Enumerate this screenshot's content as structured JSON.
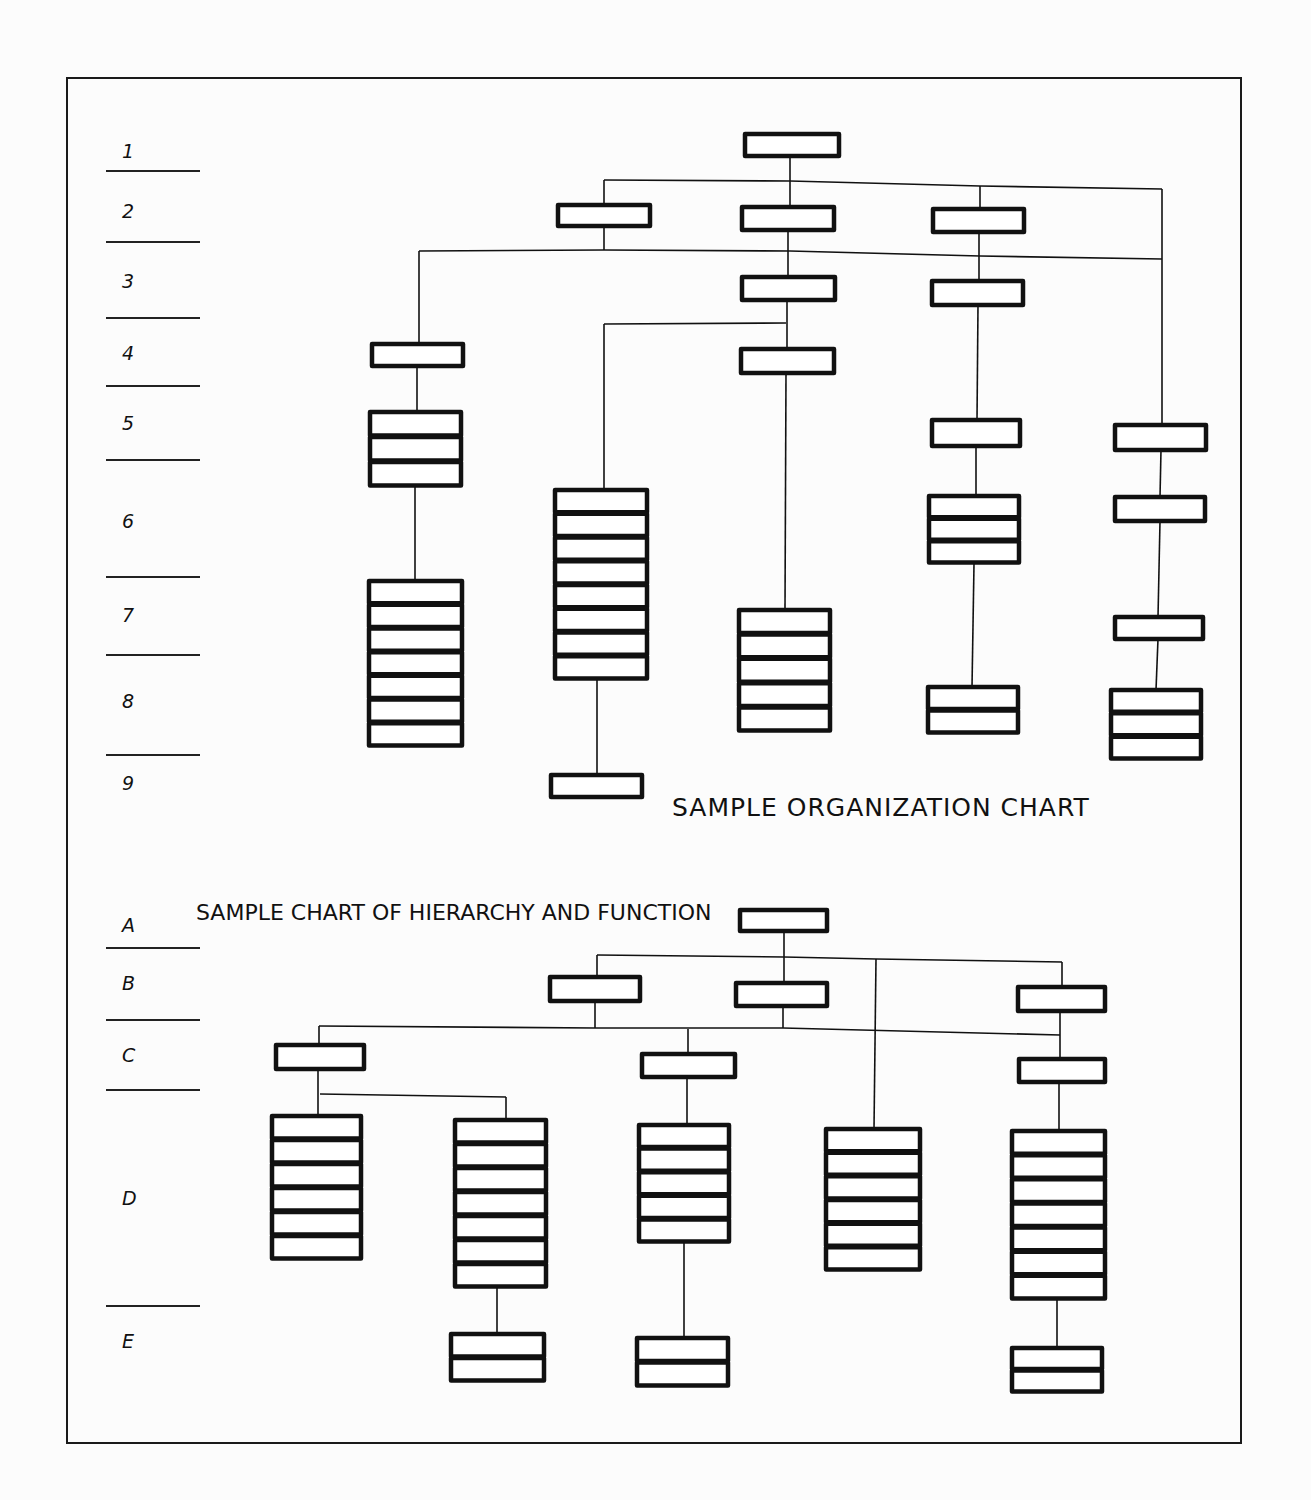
{
  "colors": {
    "ink": "#111111",
    "paper": "#fcfcfc"
  },
  "frame": {
    "x": 67,
    "y": 78,
    "w": 1174,
    "h": 1365
  },
  "top_chart": {
    "title": "SAMPLE ORGANIZATION CHART",
    "title_pos": {
      "x": 672,
      "y": 816
    },
    "levels": [
      {
        "label": "1",
        "ty": 158,
        "ry": 171
      },
      {
        "label": "2",
        "ty": 218,
        "ry": 242
      },
      {
        "label": "3",
        "ty": 288,
        "ry": 318
      },
      {
        "label": "4",
        "ty": 360,
        "ry": 386
      },
      {
        "label": "5",
        "ty": 430,
        "ry": 460
      },
      {
        "label": "6",
        "ty": 528,
        "ry": 577
      },
      {
        "label": "7",
        "ty": 622,
        "ry": 655
      },
      {
        "label": "8",
        "ty": 708,
        "ry": 755
      },
      {
        "label": "9",
        "ty": 790,
        "ry": null
      }
    ],
    "boxes": [
      {
        "x": 745,
        "y": 134,
        "w": 94,
        "h": 22,
        "n": 1
      },
      {
        "x": 558,
        "y": 205,
        "w": 92,
        "h": 21,
        "n": 1
      },
      {
        "x": 742,
        "y": 207,
        "w": 92,
        "h": 23,
        "n": 1
      },
      {
        "x": 933,
        "y": 209,
        "w": 91,
        "h": 23,
        "n": 1
      },
      {
        "x": 742,
        "y": 277,
        "w": 93,
        "h": 23,
        "n": 1
      },
      {
        "x": 932,
        "y": 281,
        "w": 91,
        "h": 24,
        "n": 1
      },
      {
        "x": 372,
        "y": 344,
        "w": 91,
        "h": 22,
        "n": 1
      },
      {
        "x": 741,
        "y": 349,
        "w": 93,
        "h": 24,
        "n": 1
      },
      {
        "x": 370,
        "y": 412,
        "w": 91,
        "h": 75,
        "n": 3
      },
      {
        "x": 932,
        "y": 420,
        "w": 88,
        "h": 26,
        "n": 1
      },
      {
        "x": 1115,
        "y": 425,
        "w": 91,
        "h": 25,
        "n": 1
      },
      {
        "x": 555,
        "y": 490,
        "w": 92,
        "h": 190,
        "n": 8
      },
      {
        "x": 929,
        "y": 496,
        "w": 90,
        "h": 68,
        "n": 3
      },
      {
        "x": 1115,
        "y": 497,
        "w": 90,
        "h": 24,
        "n": 1
      },
      {
        "x": 369,
        "y": 581,
        "w": 93,
        "h": 166,
        "n": 7
      },
      {
        "x": 739,
        "y": 610,
        "w": 91,
        "h": 122,
        "n": 5
      },
      {
        "x": 1115,
        "y": 617,
        "w": 88,
        "h": 22,
        "n": 1
      },
      {
        "x": 928,
        "y": 687,
        "w": 90,
        "h": 47,
        "n": 2
      },
      {
        "x": 1111,
        "y": 690,
        "w": 90,
        "h": 70,
        "n": 3
      },
      {
        "x": 551,
        "y": 775,
        "w": 91,
        "h": 22,
        "n": 1
      }
    ],
    "lines": [
      [
        [
          790,
          156
        ],
        [
          790,
          207
        ]
      ],
      [
        [
          604,
          180
        ],
        [
          790,
          181
        ],
        [
          980,
          186
        ],
        [
          1162,
          189
        ]
      ],
      [
        [
          604,
          180
        ],
        [
          604,
          205
        ]
      ],
      [
        [
          980,
          186
        ],
        [
          980,
          209
        ]
      ],
      [
        [
          1162,
          189
        ],
        [
          1162,
          425
        ]
      ],
      [
        [
          604,
          226
        ],
        [
          604,
          250
        ]
      ],
      [
        [
          419,
          251
        ],
        [
          604,
          250
        ],
        [
          790,
          251
        ],
        [
          980,
          256
        ],
        [
          1162,
          259
        ]
      ],
      [
        [
          788,
          230
        ],
        [
          788,
          277
        ]
      ],
      [
        [
          979,
          232
        ],
        [
          979,
          281
        ]
      ],
      [
        [
          419,
          251
        ],
        [
          419,
          344
        ]
      ],
      [
        [
          417,
          366
        ],
        [
          417,
          412
        ]
      ],
      [
        [
          415,
          487
        ],
        [
          415,
          581
        ]
      ],
      [
        [
          787,
          300
        ],
        [
          787,
          349
        ]
      ],
      [
        [
          604,
          324
        ],
        [
          786,
          323
        ]
      ],
      [
        [
          604,
          324
        ],
        [
          604,
          490
        ]
      ],
      [
        [
          786,
          373
        ],
        [
          785,
          610
        ]
      ],
      [
        [
          978,
          305
        ],
        [
          977,
          420
        ]
      ],
      [
        [
          976,
          446
        ],
        [
          976,
          496
        ]
      ],
      [
        [
          974,
          564
        ],
        [
          972,
          687
        ]
      ],
      [
        [
          1161,
          450
        ],
        [
          1160,
          497
        ]
      ],
      [
        [
          1160,
          521
        ],
        [
          1158,
          617
        ]
      ],
      [
        [
          1158,
          639
        ],
        [
          1156,
          690
        ]
      ],
      [
        [
          597,
          680
        ],
        [
          597,
          775
        ]
      ]
    ]
  },
  "bottom_chart": {
    "title": "SAMPLE CHART OF HIERARCHY AND FUNCTION",
    "title_pos": {
      "x": 196,
      "y": 920
    },
    "levels": [
      {
        "label": "A",
        "ty": 932,
        "ry": 948
      },
      {
        "label": "B",
        "ty": 990,
        "ry": 1020
      },
      {
        "label": "C",
        "ty": 1062,
        "ry": 1090
      },
      {
        "label": "D",
        "ty": 1205,
        "ry": 1306
      },
      {
        "label": "E",
        "ty": 1348,
        "ry": null
      }
    ],
    "boxes": [
      {
        "x": 740,
        "y": 910,
        "w": 87,
        "h": 21,
        "n": 1
      },
      {
        "x": 550,
        "y": 977,
        "w": 90,
        "h": 24,
        "n": 1
      },
      {
        "x": 736,
        "y": 983,
        "w": 91,
        "h": 23,
        "n": 1
      },
      {
        "x": 1018,
        "y": 987,
        "w": 87,
        "h": 24,
        "n": 1
      },
      {
        "x": 276,
        "y": 1045,
        "w": 88,
        "h": 24,
        "n": 1
      },
      {
        "x": 642,
        "y": 1054,
        "w": 93,
        "h": 23,
        "n": 1
      },
      {
        "x": 1019,
        "y": 1059,
        "w": 86,
        "h": 23,
        "n": 1
      },
      {
        "x": 272,
        "y": 1116,
        "w": 89,
        "h": 144,
        "n": 6
      },
      {
        "x": 455,
        "y": 1120,
        "w": 91,
        "h": 168,
        "n": 7
      },
      {
        "x": 639,
        "y": 1125,
        "w": 90,
        "h": 118,
        "n": 5
      },
      {
        "x": 826,
        "y": 1129,
        "w": 94,
        "h": 142,
        "n": 6
      },
      {
        "x": 1012,
        "y": 1131,
        "w": 93,
        "h": 169,
        "n": 7
      },
      {
        "x": 451,
        "y": 1334,
        "w": 93,
        "h": 48,
        "n": 2
      },
      {
        "x": 637,
        "y": 1338,
        "w": 91,
        "h": 49,
        "n": 2
      },
      {
        "x": 1012,
        "y": 1348,
        "w": 90,
        "h": 45,
        "n": 2
      }
    ],
    "lines": [
      [
        [
          784,
          931
        ],
        [
          784,
          983
        ]
      ],
      [
        [
          597,
          955
        ],
        [
          784,
          957
        ],
        [
          876,
          959
        ],
        [
          1062,
          962
        ]
      ],
      [
        [
          597,
          955
        ],
        [
          597,
          977
        ]
      ],
      [
        [
          1062,
          962
        ],
        [
          1062,
          987
        ]
      ],
      [
        [
          876,
          959
        ],
        [
          874,
          1129
        ]
      ],
      [
        [
          595,
          1001
        ],
        [
          595,
          1028
        ]
      ],
      [
        [
          319,
          1026
        ],
        [
          595,
          1028
        ],
        [
          783,
          1028
        ],
        [
          1060,
          1035
        ]
      ],
      [
        [
          783,
          1006
        ],
        [
          783,
          1028
        ]
      ],
      [
        [
          1060,
          1011
        ],
        [
          1060,
          1059
        ]
      ],
      [
        [
          319,
          1026
        ],
        [
          319,
          1045
        ]
      ],
      [
        [
          688,
          1029
        ],
        [
          688,
          1054
        ]
      ],
      [
        [
          318,
          1069
        ],
        [
          318,
          1116
        ]
      ],
      [
        [
          320,
          1094
        ],
        [
          506,
          1097
        ]
      ],
      [
        [
          506,
          1097
        ],
        [
          506,
          1120
        ]
      ],
      [
        [
          687,
          1077
        ],
        [
          687,
          1125
        ]
      ],
      [
        [
          1059,
          1082
        ],
        [
          1059,
          1131
        ]
      ],
      [
        [
          497,
          1288
        ],
        [
          497,
          1334
        ]
      ],
      [
        [
          684,
          1243
        ],
        [
          684,
          1338
        ]
      ],
      [
        [
          1057,
          1300
        ],
        [
          1057,
          1348
        ]
      ]
    ]
  },
  "level_rule": {
    "x1": 106,
    "x2": 200
  }
}
